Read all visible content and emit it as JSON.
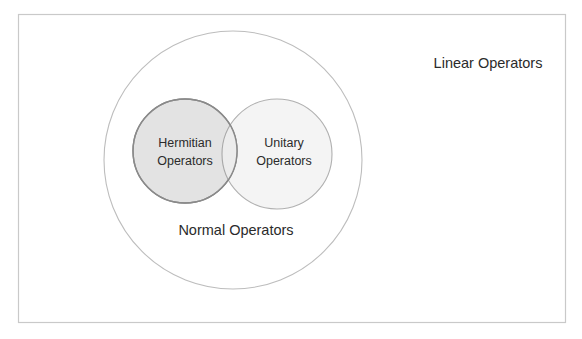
{
  "figure": {
    "background_color": "#ffffff",
    "frame": {
      "name": "outer-frame",
      "x": 18,
      "y": 14,
      "width": 547,
      "height": 308,
      "stroke_color": "#c9c9c9",
      "fill_color": "#ffffff"
    }
  },
  "chart_data": {
    "type": "venn",
    "sets": [
      {
        "id": "linear",
        "label": "Linear Operators",
        "shape": "rectangle",
        "contains": [
          "normal",
          "hermitian",
          "unitary"
        ],
        "fill_color": "#ffffff",
        "stroke_color": "#c9c9c9",
        "label_x": 488,
        "label_y": 64
      },
      {
        "id": "normal",
        "label": "Normal Operators",
        "shape": "circle",
        "cx": 233,
        "cy": 160,
        "r": 129,
        "contains": [
          "hermitian",
          "unitary"
        ],
        "fill_color": "#ffffff",
        "stroke_color": "#bdbdbd",
        "label_x": 236,
        "label_y": 231
      },
      {
        "id": "hermitian",
        "label_line1": "Hermitian",
        "label_line2": "Operators",
        "label": "Hermitian Operators",
        "shape": "circle",
        "cx": 185,
        "cy": 151,
        "r": 52,
        "fill_color": "#e3e3e3",
        "stroke_color": "#8a8a8a",
        "label_x": 185,
        "label_y": 151
      },
      {
        "id": "unitary",
        "label_line1": "Unitary",
        "label_line2": "Operators",
        "label": "Unitary Operators",
        "shape": "circle",
        "cx": 277,
        "cy": 154,
        "r": 55,
        "fill_color": "#f4f4f4",
        "stroke_color": "#b0b0b0",
        "label_x": 284,
        "label_y": 152
      }
    ],
    "intersections": [
      {
        "between": [
          "hermitian",
          "unitary"
        ],
        "label": "",
        "fill_color": "#ececec"
      }
    ],
    "legend": "none",
    "grid": false
  }
}
